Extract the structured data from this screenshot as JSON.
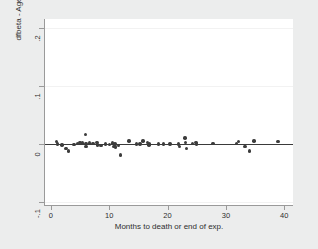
{
  "chart_data": {
    "type": "scatter",
    "title": "",
    "xlabel": "Months to death or end of exp.",
    "ylabel": "dfbeta - Age",
    "xlim": [
      -1,
      41.5
    ],
    "ylim": [
      -0.105,
      0.215
    ],
    "xticks": [
      0,
      10,
      20,
      30,
      40
    ],
    "xticklabels": [
      "0",
      "10",
      "20",
      "30",
      "40"
    ],
    "yticks": [
      -0.1,
      0,
      0.1,
      0.2
    ],
    "yticklabels": [
      "-.1",
      "0",
      ".1",
      ".2"
    ],
    "grid": "horizontal-faint",
    "legend": "none",
    "marker": "filled-circle",
    "marker_color": "#3c3c3c",
    "reference_line": {
      "axis": "y",
      "value": 0,
      "color": "#3a3a3a"
    },
    "points": [
      {
        "x": 1.0,
        "y": 0.004
      },
      {
        "x": 1.1,
        "y": 0.0
      },
      {
        "x": 1.9,
        "y": -0.002
      },
      {
        "x": 2.6,
        "y": -0.008
      },
      {
        "x": 3.0,
        "y": -0.012
      },
      {
        "x": 4.0,
        "y": -0.001
      },
      {
        "x": 4.6,
        "y": 0.001
      },
      {
        "x": 5.0,
        "y": 0.003
      },
      {
        "x": 5.4,
        "y": 0.002
      },
      {
        "x": 5.9,
        "y": 0.016
      },
      {
        "x": 6.0,
        "y": 0.001
      },
      {
        "x": 6.0,
        "y": -0.004
      },
      {
        "x": 6.6,
        "y": 0.002
      },
      {
        "x": 7.2,
        "y": 0.001
      },
      {
        "x": 7.9,
        "y": 0.003
      },
      {
        "x": 8.0,
        "y": -0.002
      },
      {
        "x": 8.6,
        "y": -0.003
      },
      {
        "x": 9.4,
        "y": 0.0
      },
      {
        "x": 10.1,
        "y": -0.001
      },
      {
        "x": 10.6,
        "y": 0.002
      },
      {
        "x": 10.8,
        "y": -0.004
      },
      {
        "x": 11.0,
        "y": 0.0
      },
      {
        "x": 11.1,
        "y": -0.005
      },
      {
        "x": 11.6,
        "y": -0.003
      },
      {
        "x": 11.9,
        "y": -0.019
      },
      {
        "x": 13.4,
        "y": 0.005
      },
      {
        "x": 14.7,
        "y": 0.0
      },
      {
        "x": 15.3,
        "y": 0.0
      },
      {
        "x": 15.8,
        "y": 0.005
      },
      {
        "x": 16.6,
        "y": 0.003
      },
      {
        "x": 16.8,
        "y": -0.002
      },
      {
        "x": 16.9,
        "y": 0.0
      },
      {
        "x": 18.5,
        "y": 0.0
      },
      {
        "x": 19.3,
        "y": 0.0
      },
      {
        "x": 20.4,
        "y": 0.0
      },
      {
        "x": 21.9,
        "y": 0.0
      },
      {
        "x": 22.1,
        "y": -0.004
      },
      {
        "x": 23.0,
        "y": 0.01
      },
      {
        "x": 23.1,
        "y": 0.003
      },
      {
        "x": 23.2,
        "y": -0.008
      },
      {
        "x": 24.3,
        "y": 0.001
      },
      {
        "x": 24.9,
        "y": 0.003
      },
      {
        "x": 25.0,
        "y": 0.0
      },
      {
        "x": 27.8,
        "y": 0.001
      },
      {
        "x": 31.8,
        "y": 0.001
      },
      {
        "x": 32.2,
        "y": 0.004
      },
      {
        "x": 33.3,
        "y": -0.004
      },
      {
        "x": 34.0,
        "y": -0.012
      },
      {
        "x": 34.8,
        "y": 0.005
      },
      {
        "x": 38.9,
        "y": 0.004
      }
    ]
  }
}
